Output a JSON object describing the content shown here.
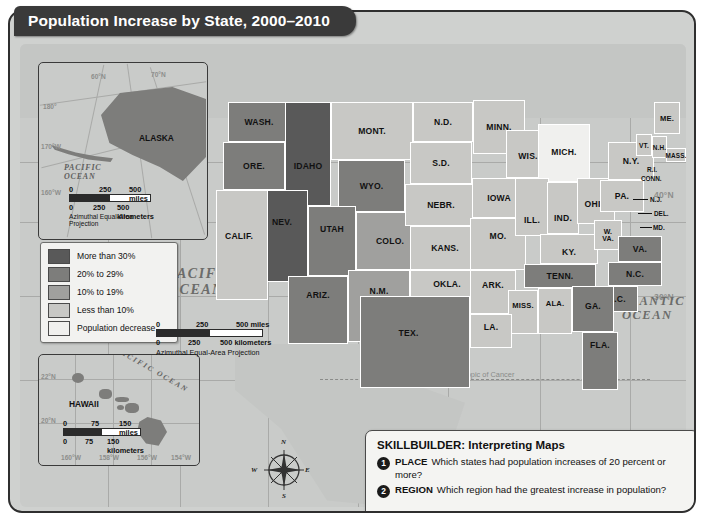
{
  "title": "Population Increase by State, 2000–2010",
  "legend": {
    "items": [
      {
        "label": "More than 30%",
        "color": "#595959"
      },
      {
        "label": "20% to 29%",
        "color": "#7d7d7b"
      },
      {
        "label": "10% to 19%",
        "color": "#a0a09e"
      },
      {
        "label": "Less than 10%",
        "color": "#c8c8c5"
      },
      {
        "label": "Population decrease",
        "color": "#f0f0ee"
      }
    ]
  },
  "main_map": {
    "ocean_labels": [
      {
        "name": "pacific-ocean-label",
        "text": "PACIFIC\nOCEAN"
      },
      {
        "name": "atlantic-ocean-label",
        "text": "ATLANTIC\nOCEAN"
      }
    ],
    "pacific": "PACIFIC",
    "pacific2": "OCEAN",
    "atlantic": "ATLANTIC",
    "atlantic2": "OCEAN",
    "tropic_of_cancer": "Tropic of Cancer",
    "longitude_labels": [
      "120°W",
      "110°W",
      "100°W",
      "90°W",
      "80°W",
      "70°W"
    ],
    "latitude_labels": [
      "40°N",
      "30°N"
    ],
    "scale": {
      "miles": [
        "0",
        "250",
        "500 miles"
      ],
      "kilometers": [
        "0",
        "250",
        "500 kilometers"
      ],
      "projection": "Azimuthal Equal-Area Projection"
    },
    "compass": {
      "n": "N",
      "e": "E",
      "s": "S",
      "w": "W"
    },
    "states": [
      {
        "abbr": "WASH.",
        "cat": 2
      },
      {
        "abbr": "ORE.",
        "cat": 2
      },
      {
        "abbr": "IDAHO",
        "cat": 0
      },
      {
        "abbr": "MONT.",
        "cat": 3
      },
      {
        "abbr": "N.D.",
        "cat": 3
      },
      {
        "abbr": "MINN.",
        "cat": 3
      },
      {
        "abbr": "WIS.",
        "cat": 3
      },
      {
        "abbr": "MICH.",
        "cat": 4
      },
      {
        "abbr": "WYO.",
        "cat": 2
      },
      {
        "abbr": "S.D.",
        "cat": 3
      },
      {
        "abbr": "IOWA",
        "cat": 3
      },
      {
        "abbr": "NEV.",
        "cat": 0
      },
      {
        "abbr": "UTAH",
        "cat": 1
      },
      {
        "abbr": "COLO.",
        "cat": 2
      },
      {
        "abbr": "NEBR.",
        "cat": 3
      },
      {
        "abbr": "CALIF.",
        "cat": 3
      },
      {
        "abbr": "ARIZ.",
        "cat": 1
      },
      {
        "abbr": "N.M.",
        "cat": 3
      },
      {
        "abbr": "KANS.",
        "cat": 3
      },
      {
        "abbr": "MO.",
        "cat": 3
      },
      {
        "abbr": "ILL.",
        "cat": 3
      },
      {
        "abbr": "IND.",
        "cat": 3
      },
      {
        "abbr": "OHIO",
        "cat": 3
      },
      {
        "abbr": "PA.",
        "cat": 3
      },
      {
        "abbr": "N.Y.",
        "cat": 3
      },
      {
        "abbr": "OKLA.",
        "cat": 3
      },
      {
        "abbr": "ARK.",
        "cat": 3
      },
      {
        "abbr": "TENN.",
        "cat": 2
      },
      {
        "abbr": "KY.",
        "cat": 3
      },
      {
        "abbr": "W. VA.",
        "cat": 3
      },
      {
        "abbr": "VA.",
        "cat": 2
      },
      {
        "abbr": "N.C.",
        "cat": 2
      },
      {
        "abbr": "TEX.",
        "cat": 1
      },
      {
        "abbr": "LA.",
        "cat": 3
      },
      {
        "abbr": "MISS.",
        "cat": 3
      },
      {
        "abbr": "ALA.",
        "cat": 3
      },
      {
        "abbr": "GA.",
        "cat": 2
      },
      {
        "abbr": "S.C.",
        "cat": 2
      },
      {
        "abbr": "FLA.",
        "cat": 2
      },
      {
        "abbr": "ME.",
        "cat": 3
      },
      {
        "abbr": "VT.",
        "cat": 3
      },
      {
        "abbr": "N.H.",
        "cat": 3
      },
      {
        "abbr": "MASS.",
        "cat": 3
      }
    ],
    "callout_states": [
      "R.I.",
      "CONN.",
      "N.J.",
      "DEL.",
      "MD."
    ]
  },
  "alaska_inset": {
    "state_label": "ALASKA",
    "ocean_label_1": "PACIFIC",
    "ocean_label_2": "OCEAN",
    "grid_labels": [
      "180°",
      "170°W",
      "160°W",
      "60°N",
      "70°N"
    ],
    "scale": {
      "miles": [
        "0",
        "250",
        "500 miles"
      ],
      "kilometers": [
        "0",
        "250",
        "500 kilometers"
      ],
      "projection": "Azimuthal Equal-Area Projection"
    }
  },
  "hawaii_inset": {
    "state_label": "HAWAII",
    "ocean_label": "PACIFIC OCEAN",
    "grid_labels": [
      "22°N",
      "20°N",
      "160°W",
      "158°W",
      "156°W",
      "154°W"
    ],
    "scale": {
      "miles": [
        "0",
        "75",
        "150 miles"
      ],
      "kilometers": [
        "0",
        "75",
        "150 kilometers"
      ]
    }
  },
  "skillbuilder": {
    "title": "SKILLBUILDER: Interpreting Maps",
    "questions": [
      {
        "num": "1",
        "tag": "PLACE",
        "text": "Which states had population increases of 20 percent or more?"
      },
      {
        "num": "2",
        "tag": "REGION",
        "text": "Which region had the greatest increase in population?"
      }
    ]
  }
}
